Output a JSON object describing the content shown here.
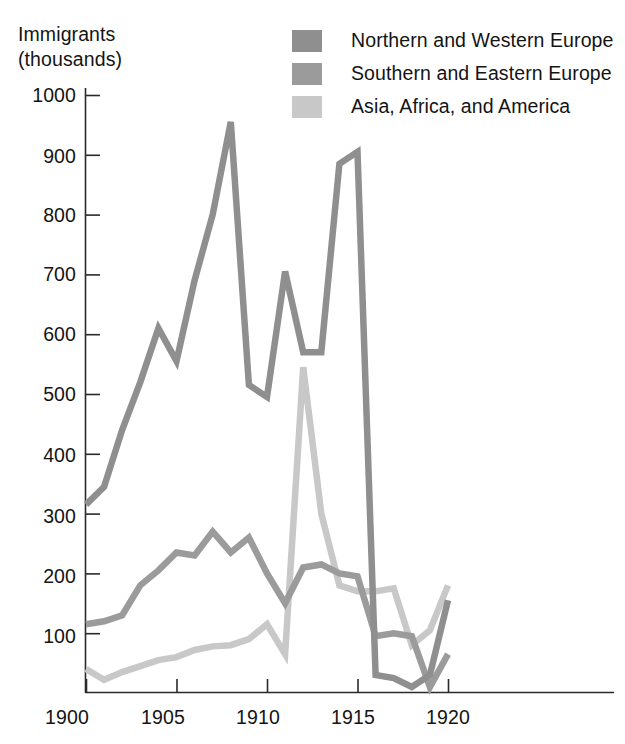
{
  "axis_title": "Immigrants\n(thousands)",
  "legend": {
    "items": [
      {
        "label": "Northern and Western Europe",
        "color": "#8f8f8f",
        "swatch_name": "legend-swatch-northern-western-europe"
      },
      {
        "label": "Southern and Eastern Europe",
        "color": "#9b9b9b",
        "swatch_name": "legend-swatch-southern-eastern-europe"
      },
      {
        "label": "Asia, Africa, and America",
        "color": "#c8c8c8",
        "swatch_name": "legend-swatch-asia-africa-america"
      }
    ]
  },
  "y_ticks": [
    "1000",
    "900",
    "800",
    "700",
    "600",
    "500",
    "400",
    "300",
    "200",
    "100"
  ],
  "x_ticks": [
    "1900",
    "1905",
    "1910",
    "1915",
    "1920"
  ],
  "chart_data": {
    "type": "line",
    "title": "",
    "xlabel": "",
    "ylabel": "Immigrants (thousands)",
    "xlim": [
      1900,
      1920
    ],
    "ylim": [
      0,
      1030
    ],
    "grid": false,
    "legend_position": "top-right",
    "x": [
      1900,
      1901,
      1902,
      1903,
      1904,
      1905,
      1906,
      1907,
      1908,
      1909,
      1910,
      1911,
      1912,
      1913,
      1914,
      1915,
      1916,
      1917,
      1918,
      1919,
      1920
    ],
    "series": [
      {
        "name": "Northern and Western Europe",
        "color": "#8f8f8f",
        "values": [
          315,
          345,
          440,
          520,
          610,
          555,
          690,
          800,
          955,
          515,
          495,
          705,
          570,
          570,
          885,
          905,
          30,
          25,
          10,
          30,
          155
        ]
      },
      {
        "name": "Southern and Eastern Europe",
        "color": "#9b9b9b",
        "values": [
          115,
          120,
          130,
          180,
          205,
          235,
          230,
          270,
          235,
          260,
          200,
          150,
          210,
          215,
          200,
          195,
          95,
          100,
          95,
          10,
          65
        ]
      },
      {
        "name": "Asia, Africa, and America",
        "color": "#c8c8c8",
        "values": [
          40,
          22,
          35,
          45,
          55,
          60,
          72,
          78,
          80,
          90,
          115,
          65,
          545,
          300,
          180,
          170,
          170,
          175,
          80,
          105,
          180
        ]
      }
    ]
  }
}
